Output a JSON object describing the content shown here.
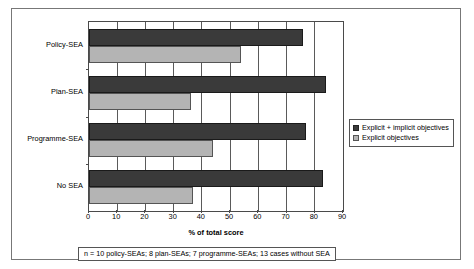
{
  "chart_data": {
    "type": "bar",
    "orientation": "horizontal",
    "title": "",
    "xlabel": "% of total score",
    "ylabel": "",
    "xlim": [
      0,
      90
    ],
    "xticks": [
      0,
      10,
      20,
      30,
      40,
      50,
      60,
      70,
      80,
      90
    ],
    "grid": "vertical",
    "legend_position": "right",
    "categories": [
      "Policy-SEA",
      "Plan-SEA",
      "Programme-SEA",
      "No SEA"
    ],
    "series": [
      {
        "name": "Explicit + implicit objectives",
        "color": "#3a3a3a",
        "values": [
          76,
          84,
          77,
          83
        ]
      },
      {
        "name": "Explicit objectives",
        "color": "#b4b4b4",
        "values": [
          54,
          36,
          44,
          37
        ]
      }
    ],
    "footnote": "n = 10 policy-SEAs; 8 plan-SEAs; 7 programme-SEAs; 13 cases without SEA"
  },
  "legend": {
    "items": [
      {
        "label": "Explicit + implicit objectives",
        "swatch": "dark"
      },
      {
        "label": "Explicit objectives",
        "swatch": "light"
      }
    ]
  },
  "axis": {
    "x_title": "% of total score",
    "tick_labels": [
      "0",
      "10",
      "20",
      "30",
      "40",
      "50",
      "60",
      "70",
      "80",
      "90"
    ],
    "category_labels": [
      "Policy-SEA",
      "Plan-SEA",
      "Programme-SEA",
      "No SEA"
    ]
  },
  "footnote": {
    "text": "n = 10 policy-SEAs; 8 plan-SEAs; 7 programme-SEAs; 13 cases without SEA"
  }
}
